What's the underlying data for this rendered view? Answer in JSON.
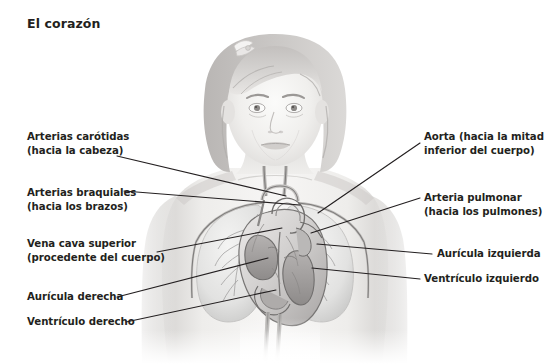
{
  "page": {
    "title": "El corazón",
    "background": "#ffffff",
    "text_color": "#231f20",
    "line_color": "#231f20",
    "width": 550,
    "height": 364
  },
  "illustration": {
    "name": "child-torso-heart-anatomy",
    "description": "Grayscale illustration of a young child from the head to the abdomen, with the chest made transparent to reveal the lungs, the heart in cross-section and the great vessels",
    "palette": {
      "skin_light": "#f2f1ef",
      "skin_mid": "#dcdad8",
      "skin_shadow": "#bdbab8",
      "hair_light": "#d8d6d4",
      "hair_mid": "#b4b1af",
      "hair_dark": "#8e8b89",
      "lung_light": "#ececeb",
      "lung_mid": "#cfcfce",
      "vessel_outline": "#6f6d6c",
      "heart_light": "#f6f6f5",
      "heart_mid": "#c9c7c6",
      "heart_dark": "#9a9796"
    }
  },
  "labels": {
    "left": [
      {
        "name": "arterias-carotidas",
        "line1": "Arterias carótidas",
        "line2": "(hacia la cabeza)",
        "x": 27,
        "y": 130,
        "leader": {
          "x1": 117,
          "y1": 156,
          "x2": 286,
          "y2": 196
        }
      },
      {
        "name": "arterias-braquiales",
        "line1": "Arterias braquiales",
        "line2": "(hacia los brazos)",
        "x": 27,
        "y": 186,
        "leader": {
          "x1": 124,
          "y1": 191,
          "x2": 300,
          "y2": 205
        }
      },
      {
        "name": "vena-cava-superior",
        "line1": "Vena cava superior",
        "line2": "(procedente del cuerpo)",
        "x": 27,
        "y": 237,
        "leader": {
          "x1": 157,
          "y1": 252,
          "x2": 282,
          "y2": 228
        }
      },
      {
        "name": "auricula-derecha",
        "line1": "Aurícula derecha",
        "line2": "",
        "x": 27,
        "y": 293,
        "leader": {
          "x1": 117,
          "y1": 297,
          "x2": 268,
          "y2": 258
        }
      },
      {
        "name": "ventriculo-derecho",
        "line1": "Ventrículo derecho",
        "line2": "",
        "x": 27,
        "y": 318,
        "leader": {
          "x1": 126,
          "y1": 322,
          "x2": 276,
          "y2": 290
        }
      }
    ],
    "right": [
      {
        "name": "aorta",
        "line1": "Aorta (hacia la mitad",
        "line2": "inferior del cuerpo)",
        "x": 424,
        "y": 130,
        "leader": {
          "x1": 420,
          "y1": 143,
          "x2": 318,
          "y2": 213
        }
      },
      {
        "name": "arteria-pulmonar",
        "line1": "Arteria pulmonar",
        "line2": "(hacia los pulmones)",
        "x": 424,
        "y": 191,
        "leader": {
          "x1": 420,
          "y1": 198,
          "x2": 311,
          "y2": 233
        }
      },
      {
        "name": "auricula-izquierda",
        "line1": "Aurícula izquierda",
        "line2": "",
        "x": 437,
        "y": 248,
        "leader": {
          "x1": 432,
          "y1": 254,
          "x2": 317,
          "y2": 244
        }
      },
      {
        "name": "ventriculo-izquierdo",
        "line1": "Ventrículo izquierdo",
        "line2": "",
        "x": 424,
        "y": 273,
        "leader": {
          "x1": 420,
          "y1": 279,
          "x2": 312,
          "y2": 268
        }
      }
    ]
  }
}
